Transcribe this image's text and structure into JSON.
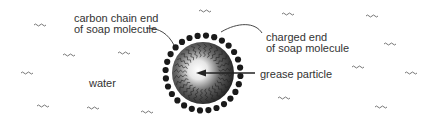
{
  "diagram": {
    "labels": {
      "carbon_chain": [
        "carbon chain end",
        "of soap molecule"
      ],
      "charged_end": [
        "charged end",
        "of soap molecule"
      ],
      "grease": "grease particle",
      "water": "water"
    },
    "colors": {
      "text": "#333333",
      "dots": "#1a1a1a",
      "sphere_dark": "#1e1e1e",
      "sphere_light": "#f2f2f2",
      "water_marks": "#555555"
    }
  }
}
